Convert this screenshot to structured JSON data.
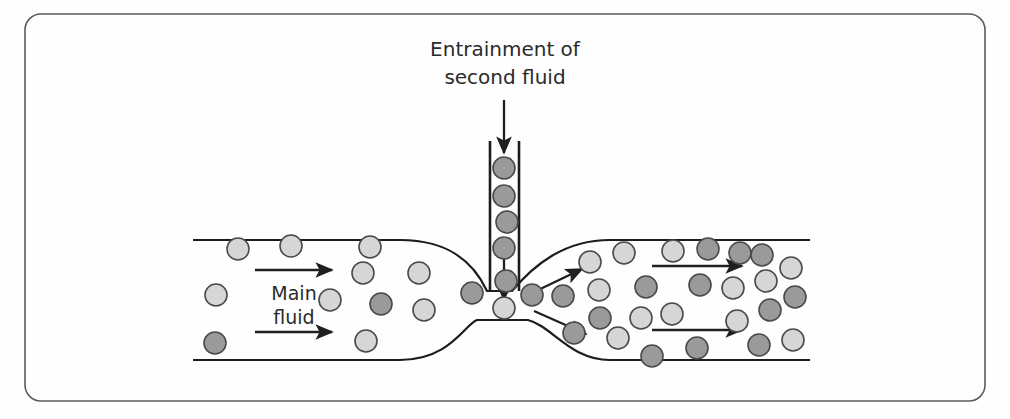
{
  "figure": {
    "name": "venturi-eductor-entrainment-diagram",
    "background_color": "#fefefe",
    "frame": {
      "x": 25,
      "y": 14,
      "width": 960,
      "height": 387,
      "corner_radius": 16,
      "stroke_color": "#5b5b5f",
      "stroke_width": 1.6
    }
  },
  "labels": {
    "entrainment_line1": "Entrainment of",
    "entrainment_line2": "second fluid",
    "main_fluid_line1": "Main",
    "main_fluid_line2": "fluid",
    "font_size_title": 20,
    "font_size_main": 19,
    "text_color": "#2b2b2b"
  },
  "colors": {
    "duct_stroke": "#1c1c1c",
    "tube_stroke": "#1c1c1c",
    "arrow_color": "#1f1f1f",
    "particle_light_fill": "#d6d6d6",
    "particle_dark_fill": "#9a9a9a",
    "particle_stroke": "#4a4a4a"
  },
  "geometry": {
    "duct_left_x": 193,
    "duct_right_x": 810,
    "duct_top_y": 240,
    "duct_bottom_y": 360,
    "throat_left_x": 487,
    "throat_right_x": 512,
    "throat_top_y": 291,
    "throat_bottom_y": 320,
    "converge_start_x": 400,
    "diverge_end_x": 610,
    "tube_left_x": 490,
    "tube_right_x": 519,
    "tube_top_y": 141,
    "duct_stroke_width": 2.2,
    "tube_stroke_width": 2.6
  },
  "flow_arrows": {
    "inlet_upper": {
      "x1": 255,
      "y1": 270,
      "x2": 332,
      "y2": 270
    },
    "inlet_lower": {
      "x1": 255,
      "y1": 332,
      "x2": 332,
      "y2": 332
    },
    "outlet_upper": {
      "x1": 652,
      "y1": 266,
      "x2": 742,
      "y2": 266
    },
    "outlet_lower": {
      "x1": 652,
      "y1": 330,
      "x2": 742,
      "y2": 330
    },
    "diverge_upper": {
      "x1": 534,
      "y1": 292,
      "x2": 582,
      "y2": 269
    },
    "diverge_lower": {
      "x1": 534,
      "y1": 311,
      "x2": 586,
      "y2": 334
    },
    "tube_feed_top": {
      "x1": 504,
      "y1": 100,
      "x2": 504,
      "y2": 153
    },
    "tube_feed_bottom": {
      "x1": 504,
      "y1": 258,
      "x2": 504,
      "y2": 300
    }
  },
  "chart_data": {
    "type": "diagram",
    "particles": {
      "radius_light": 11,
      "radius_dark": 11,
      "inlet": [
        {
          "x": 238,
          "y": 249,
          "shade": "light"
        },
        {
          "x": 291,
          "y": 246,
          "shade": "light"
        },
        {
          "x": 216,
          "y": 295,
          "shade": "light"
        },
        {
          "x": 215,
          "y": 343,
          "shade": "dark"
        },
        {
          "x": 330,
          "y": 300,
          "shade": "light"
        },
        {
          "x": 370,
          "y": 247,
          "shade": "light"
        },
        {
          "x": 366,
          "y": 341,
          "shade": "light"
        },
        {
          "x": 363,
          "y": 273,
          "shade": "light"
        },
        {
          "x": 419,
          "y": 273,
          "shade": "light"
        },
        {
          "x": 381,
          "y": 304,
          "shade": "dark"
        },
        {
          "x": 424,
          "y": 310,
          "shade": "light"
        },
        {
          "x": 472,
          "y": 293,
          "shade": "dark"
        }
      ],
      "tube": [
        {
          "x": 504,
          "y": 168,
          "shade": "dark"
        },
        {
          "x": 504,
          "y": 196,
          "shade": "dark"
        },
        {
          "x": 507,
          "y": 222,
          "shade": "dark"
        },
        {
          "x": 504,
          "y": 248,
          "shade": "dark"
        },
        {
          "x": 506,
          "y": 281,
          "shade": "dark"
        },
        {
          "x": 504,
          "y": 308,
          "shade": "light"
        }
      ],
      "outlet": [
        {
          "x": 532,
          "y": 295,
          "shade": "dark"
        },
        {
          "x": 563,
          "y": 296,
          "shade": "dark"
        },
        {
          "x": 590,
          "y": 262,
          "shade": "light"
        },
        {
          "x": 599,
          "y": 290,
          "shade": "light"
        },
        {
          "x": 600,
          "y": 318,
          "shade": "dark"
        },
        {
          "x": 624,
          "y": 253,
          "shade": "light"
        },
        {
          "x": 618,
          "y": 338,
          "shade": "light"
        },
        {
          "x": 646,
          "y": 287,
          "shade": "dark"
        },
        {
          "x": 652,
          "y": 356,
          "shade": "dark"
        },
        {
          "x": 673,
          "y": 251,
          "shade": "light"
        },
        {
          "x": 672,
          "y": 314,
          "shade": "light"
        },
        {
          "x": 700,
          "y": 285,
          "shade": "dark"
        },
        {
          "x": 708,
          "y": 249,
          "shade": "dark"
        },
        {
          "x": 697,
          "y": 348,
          "shade": "dark"
        },
        {
          "x": 733,
          "y": 288,
          "shade": "light"
        },
        {
          "x": 737,
          "y": 321,
          "shade": "light"
        },
        {
          "x": 740,
          "y": 253,
          "shade": "dark"
        },
        {
          "x": 762,
          "y": 255,
          "shade": "dark"
        },
        {
          "x": 766,
          "y": 281,
          "shade": "light"
        },
        {
          "x": 770,
          "y": 310,
          "shade": "dark"
        },
        {
          "x": 759,
          "y": 345,
          "shade": "dark"
        },
        {
          "x": 791,
          "y": 268,
          "shade": "light"
        },
        {
          "x": 795,
          "y": 297,
          "shade": "dark"
        },
        {
          "x": 793,
          "y": 340,
          "shade": "light"
        },
        {
          "x": 574,
          "y": 333,
          "shade": "dark"
        },
        {
          "x": 641,
          "y": 318,
          "shade": "light"
        }
      ]
    }
  }
}
